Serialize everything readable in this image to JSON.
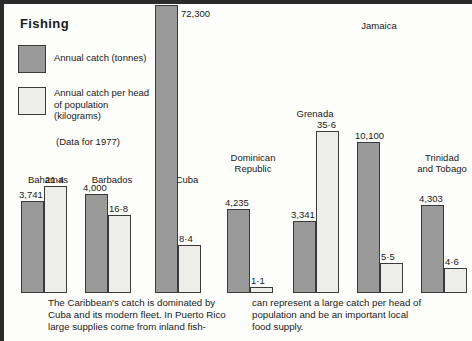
{
  "legend": {
    "title": "Fishing",
    "items": [
      {
        "swatch": "dark",
        "label": "Annual catch  (tonnes)"
      },
      {
        "swatch": "light",
        "label": "Annual catch per head\nof population\n(kilograms)"
      }
    ],
    "note": "(Data for 1977)"
  },
  "caption": {
    "left": "The Caribbean's catch is dominated by\nCuba and its modern fleet. In Puerto Rico\nlarge supplies come from inland fish-",
    "right": "can represent a large catch per head of\npopulation and be an important local\nfood supply."
  },
  "colors": {
    "dark_bar": "#9a9a9a",
    "light_bar": "#ededea",
    "bar_border": "#3a3a3a",
    "frame": "#2b2b2b",
    "background": "#fdfdfb",
    "text": "#1a1a1a"
  },
  "chart_data": {
    "type": "bar",
    "title": "Fishing",
    "subtitle": "(Data for 1977)",
    "xlabel": "",
    "ylabel": "",
    "grid": false,
    "legend_position": "top-left",
    "categories": [
      "Bahamas",
      "Barbados",
      "Cuba",
      "Dominican Republic",
      "Grenada",
      "Jamaica",
      "Trinidad and Tobago"
    ],
    "series": [
      {
        "name": "Annual catch  (tonnes)",
        "unit": "tonnes",
        "swatch": "dark",
        "values": [
          3741,
          4000,
          72300,
          4235,
          3341,
          10100,
          4303
        ],
        "labels": [
          "3,741",
          "4,000",
          "72,300",
          "4,235",
          "3,341",
          "10,100",
          "4,303"
        ]
      },
      {
        "name": "Annual catch per head of population (kilograms)",
        "unit": "kilograms",
        "swatch": "light",
        "values": [
          21.4,
          16.8,
          8.4,
          1.1,
          35.6,
          5.5,
          4.6
        ],
        "labels": [
          "21·4",
          "16·8",
          "8·4",
          "1·1",
          "35·6",
          "5·5",
          "4·6"
        ]
      }
    ]
  }
}
